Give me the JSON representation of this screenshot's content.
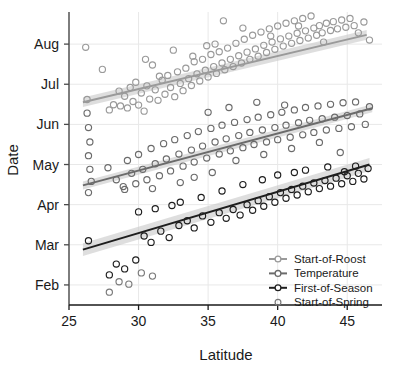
{
  "chart_data": {
    "type": "scatter",
    "title": "",
    "xlabel": "Latitude",
    "ylabel": "Date",
    "xlim": [
      25.0,
      47.5
    ],
    "ylim": [
      0.5,
      7.8
    ],
    "grid": true,
    "xticks": [
      25,
      30,
      35,
      40,
      45
    ],
    "xticklabels": [
      "25",
      "30",
      "35",
      "40",
      "45"
    ],
    "yticks": [
      1,
      2,
      3,
      4,
      5,
      6,
      7
    ],
    "yticklabels": [
      "Feb",
      "Mar",
      "Apr",
      "May",
      "Jun",
      "Jul",
      "Aug"
    ],
    "legend_position": "bottom-right",
    "legend": [
      {
        "label": "Start-of-Roost",
        "color": "#9a9a9a",
        "marker": "line-circle"
      },
      {
        "label": "Temperature",
        "color": "#6b6b6b",
        "marker": "line-circle"
      },
      {
        "label": "First-of-Season",
        "color": "#1e1e1e",
        "marker": "line-circle"
      },
      {
        "label": "Start-of-Spring",
        "color": "#7a7a7a",
        "marker": "circle"
      }
    ],
    "series": [
      {
        "name": "Start-of-Roost",
        "type": "scatter+trend",
        "color": "#9a9a9a",
        "trend": {
          "x": [
            26.0,
            46.4
          ],
          "y": [
            5.55,
            7.23
          ],
          "band": 0.12
        },
        "points": [
          [
            26.2,
            6.92
          ],
          [
            26.3,
            5.62
          ],
          [
            27.4,
            6.37
          ],
          [
            27.9,
            5.36
          ],
          [
            28.2,
            5.49
          ],
          [
            28.6,
            5.83
          ],
          [
            28.7,
            5.46
          ],
          [
            29.0,
            5.7
          ],
          [
            29.2,
            5.41
          ],
          [
            29.4,
            5.92
          ],
          [
            29.6,
            5.57
          ],
          [
            29.8,
            6.05
          ],
          [
            30.0,
            5.48
          ],
          [
            30.2,
            5.78
          ],
          [
            30.4,
            5.33
          ],
          [
            30.6,
            5.96
          ],
          [
            30.8,
            5.63
          ],
          [
            31.0,
            6.48
          ],
          [
            31.2,
            5.86
          ],
          [
            31.4,
            5.6
          ],
          [
            31.7,
            6.1
          ],
          [
            31.9,
            5.75
          ],
          [
            32.1,
            6.22
          ],
          [
            32.3,
            5.92
          ],
          [
            32.6,
            5.69
          ],
          [
            32.8,
            6.31
          ],
          [
            33.0,
            6.02
          ],
          [
            33.2,
            5.84
          ],
          [
            33.4,
            6.4
          ],
          [
            33.6,
            6.14
          ],
          [
            33.8,
            5.97
          ],
          [
            34.0,
            6.56
          ],
          [
            34.2,
            6.26
          ],
          [
            34.4,
            6.08
          ],
          [
            34.6,
            6.62
          ],
          [
            34.8,
            6.35
          ],
          [
            35.0,
            6.18
          ],
          [
            35.2,
            6.74
          ],
          [
            35.4,
            6.44
          ],
          [
            35.6,
            6.27
          ],
          [
            35.8,
            6.81
          ],
          [
            36.0,
            6.53
          ],
          [
            36.2,
            6.36
          ],
          [
            36.4,
            6.9
          ],
          [
            36.6,
            6.62
          ],
          [
            36.8,
            6.44
          ],
          [
            37.0,
            7.02
          ],
          [
            37.2,
            6.71
          ],
          [
            37.4,
            6.53
          ],
          [
            37.6,
            7.12
          ],
          [
            37.8,
            6.8
          ],
          [
            38.0,
            6.62
          ],
          [
            38.2,
            7.22
          ],
          [
            38.4,
            6.88
          ],
          [
            38.6,
            6.7
          ],
          [
            38.8,
            7.3
          ],
          [
            39.0,
            6.97
          ],
          [
            39.2,
            6.79
          ],
          [
            39.4,
            7.38
          ],
          [
            39.6,
            7.05
          ],
          [
            39.8,
            6.87
          ],
          [
            40.0,
            7.45
          ],
          [
            40.2,
            7.13
          ],
          [
            40.4,
            6.95
          ],
          [
            40.6,
            7.52
          ],
          [
            40.8,
            7.2
          ],
          [
            41.0,
            7.02
          ],
          [
            41.2,
            7.58
          ],
          [
            41.4,
            7.27
          ],
          [
            41.6,
            7.09
          ],
          [
            41.8,
            7.64
          ],
          [
            42.0,
            7.33
          ],
          [
            42.2,
            7.15
          ],
          [
            42.4,
            7.7
          ],
          [
            42.6,
            7.4
          ],
          [
            42.8,
            7.22
          ],
          [
            43.0,
            7.46
          ],
          [
            43.2,
            7.28
          ],
          [
            43.5,
            7.52
          ],
          [
            43.8,
            7.34
          ],
          [
            44.0,
            7.56
          ],
          [
            44.3,
            7.38
          ],
          [
            44.6,
            7.6
          ],
          [
            44.9,
            7.42
          ],
          [
            45.2,
            7.64
          ],
          [
            45.5,
            7.46
          ],
          [
            45.8,
            7.28
          ],
          [
            46.2,
            7.55
          ],
          [
            46.6,
            7.1
          ],
          [
            36.1,
            7.58
          ],
          [
            34.9,
            6.96
          ],
          [
            33.9,
            6.7
          ],
          [
            32.5,
            6.85
          ],
          [
            31.5,
            6.2
          ],
          [
            30.5,
            6.62
          ],
          [
            35.5,
            7.0
          ],
          [
            37.5,
            7.4
          ],
          [
            39.5,
            7.2
          ],
          [
            41.5,
            7.45
          ],
          [
            43.3,
            7.05
          ]
        ]
      },
      {
        "name": "Temperature",
        "type": "scatter+trend",
        "color": "#6b6b6b",
        "trend": {
          "x": [
            26.0,
            46.8
          ],
          "y": [
            3.48,
            5.4
          ],
          "band": 0.1
        },
        "points": [
          [
            26.3,
            5.28
          ],
          [
            26.4,
            4.92
          ],
          [
            26.5,
            4.56
          ],
          [
            26.4,
            4.22
          ],
          [
            26.5,
            3.88
          ],
          [
            26.6,
            3.58
          ],
          [
            26.4,
            3.3
          ],
          [
            27.8,
            3.92
          ],
          [
            28.4,
            3.62
          ],
          [
            28.9,
            3.45
          ],
          [
            29.2,
            4.1
          ],
          [
            29.5,
            3.78
          ],
          [
            29.8,
            3.52
          ],
          [
            30.0,
            4.25
          ],
          [
            30.3,
            3.88
          ],
          [
            30.6,
            3.62
          ],
          [
            30.9,
            4.4
          ],
          [
            31.2,
            4.02
          ],
          [
            31.5,
            3.72
          ],
          [
            31.8,
            4.52
          ],
          [
            32.0,
            4.14
          ],
          [
            32.3,
            3.84
          ],
          [
            32.6,
            4.62
          ],
          [
            32.9,
            4.26
          ],
          [
            33.2,
            3.96
          ],
          [
            33.5,
            4.72
          ],
          [
            33.8,
            4.36
          ],
          [
            34.0,
            4.06
          ],
          [
            34.3,
            4.82
          ],
          [
            34.6,
            4.46
          ],
          [
            34.9,
            4.16
          ],
          [
            35.2,
            4.9
          ],
          [
            35.5,
            4.56
          ],
          [
            35.8,
            4.26
          ],
          [
            36.0,
            4.98
          ],
          [
            36.3,
            4.64
          ],
          [
            36.6,
            4.34
          ],
          [
            36.9,
            5.05
          ],
          [
            37.2,
            4.72
          ],
          [
            37.5,
            4.42
          ],
          [
            37.8,
            5.12
          ],
          [
            38.0,
            4.8
          ],
          [
            38.3,
            4.5
          ],
          [
            38.6,
            5.18
          ],
          [
            38.9,
            4.86
          ],
          [
            39.2,
            4.56
          ],
          [
            39.5,
            5.24
          ],
          [
            39.8,
            4.92
          ],
          [
            40.0,
            4.62
          ],
          [
            40.3,
            5.3
          ],
          [
            40.6,
            4.98
          ],
          [
            40.9,
            4.68
          ],
          [
            41.2,
            5.36
          ],
          [
            41.5,
            5.04
          ],
          [
            41.8,
            4.74
          ],
          [
            42.0,
            5.42
          ],
          [
            42.3,
            5.1
          ],
          [
            42.6,
            4.8
          ],
          [
            42.9,
            5.46
          ],
          [
            43.2,
            5.14
          ],
          [
            43.5,
            4.86
          ],
          [
            43.8,
            5.5
          ],
          [
            44.1,
            5.18
          ],
          [
            44.4,
            4.9
          ],
          [
            44.7,
            5.54
          ],
          [
            45.0,
            5.22
          ],
          [
            45.3,
            4.94
          ],
          [
            45.6,
            5.56
          ],
          [
            45.9,
            5.26
          ],
          [
            46.3,
            5.0
          ],
          [
            46.6,
            5.44
          ],
          [
            35.0,
            5.3
          ],
          [
            36.5,
            5.42
          ],
          [
            38.5,
            5.55
          ],
          [
            40.5,
            5.48
          ],
          [
            37.0,
            4.1
          ],
          [
            39.0,
            4.25
          ],
          [
            41.0,
            4.4
          ],
          [
            43.0,
            4.55
          ],
          [
            44.5,
            4.3
          ],
          [
            31.0,
            3.4
          ],
          [
            33.0,
            3.55
          ],
          [
            29.0,
            3.38
          ],
          [
            35.3,
            3.8
          ],
          [
            34.0,
            3.68
          ]
        ]
      },
      {
        "name": "First-of-Season",
        "type": "scatter+trend",
        "color": "#1e1e1e",
        "trend": {
          "x": [
            26.0,
            46.6
          ],
          "y": [
            1.88,
            4.0
          ],
          "band": 0.16
        },
        "points": [
          [
            26.4,
            2.1
          ],
          [
            27.9,
            1.25
          ],
          [
            28.4,
            1.52
          ],
          [
            29.0,
            1.4
          ],
          [
            29.8,
            1.62
          ],
          [
            30.4,
            2.22
          ],
          [
            30.9,
            2.06
          ],
          [
            31.6,
            2.34
          ],
          [
            32.2,
            2.18
          ],
          [
            32.9,
            2.48
          ],
          [
            33.5,
            2.6
          ],
          [
            34.0,
            2.42
          ],
          [
            34.6,
            2.72
          ],
          [
            35.2,
            2.56
          ],
          [
            35.8,
            2.8
          ],
          [
            36.3,
            2.66
          ],
          [
            36.8,
            2.88
          ],
          [
            37.3,
            2.74
          ],
          [
            37.8,
            3.0
          ],
          [
            38.2,
            2.86
          ],
          [
            38.6,
            3.1
          ],
          [
            39.0,
            2.96
          ],
          [
            39.4,
            3.2
          ],
          [
            39.8,
            3.06
          ],
          [
            40.2,
            3.3
          ],
          [
            40.6,
            3.16
          ],
          [
            41.0,
            3.38
          ],
          [
            41.4,
            3.24
          ],
          [
            41.8,
            3.46
          ],
          [
            42.2,
            3.32
          ],
          [
            42.6,
            3.54
          ],
          [
            43.0,
            3.4
          ],
          [
            43.4,
            3.6
          ],
          [
            43.8,
            3.46
          ],
          [
            44.2,
            3.66
          ],
          [
            44.6,
            3.52
          ],
          [
            45.0,
            3.72
          ],
          [
            45.4,
            3.58
          ],
          [
            45.8,
            3.78
          ],
          [
            46.2,
            3.64
          ],
          [
            46.5,
            3.9
          ],
          [
            42.0,
            3.86
          ],
          [
            43.6,
            3.94
          ],
          [
            44.8,
            3.82
          ],
          [
            45.6,
            3.96
          ],
          [
            33.0,
            3.06
          ],
          [
            34.5,
            3.18
          ],
          [
            36.0,
            3.34
          ],
          [
            37.5,
            3.5
          ],
          [
            38.9,
            3.62
          ],
          [
            40.0,
            3.74
          ],
          [
            41.2,
            3.8
          ],
          [
            31.2,
            2.9
          ],
          [
            32.4,
            2.98
          ],
          [
            30.0,
            2.82
          ]
        ]
      },
      {
        "name": "Start-of-Spring",
        "type": "scatter",
        "color": "#7a7a7a",
        "points": [
          [
            27.9,
            0.82
          ],
          [
            28.6,
            1.08
          ],
          [
            29.3,
            1.02
          ],
          [
            30.2,
            1.3
          ],
          [
            31.0,
            1.22
          ]
        ]
      }
    ]
  }
}
